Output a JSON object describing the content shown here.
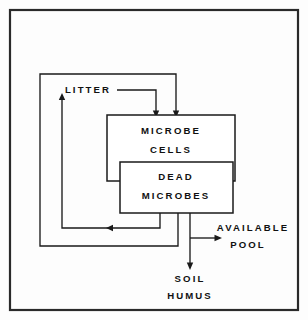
{
  "diagram": {
    "frame": {
      "stroke_color": "#2a2a2a"
    },
    "line_color": "#1a1a1a",
    "background_color": "#fdfdfd",
    "nodes": [
      {
        "id": "litter",
        "label": "LITTER",
        "kind": "text-label",
        "x": 88,
        "y": 90
      },
      {
        "id": "microbe",
        "label_line1": "MICROBE",
        "label_line2": "CELLS",
        "kind": "box",
        "x": 107,
        "y": 115,
        "w": 128,
        "h": 66
      },
      {
        "id": "dead",
        "label_line1": "DEAD",
        "label_line2": "MICROBES",
        "kind": "box",
        "x": 120,
        "y": 162,
        "w": 113,
        "h": 51
      },
      {
        "id": "available",
        "label_line1": "AVAILABLE",
        "label_line2": "POOL",
        "kind": "text-label",
        "x": 243,
        "y": 228
      },
      {
        "id": "soil",
        "label_line1": "SOIL",
        "label_line2": "HUMUS",
        "kind": "text-label",
        "x": 188,
        "y": 279
      }
    ],
    "edges": [
      {
        "id": "litter-to-microbe",
        "from": "litter",
        "to": "microbe",
        "arrow": "down"
      },
      {
        "id": "microbe-to-dead",
        "from": "microbe",
        "to": "dead",
        "arrow": "down"
      },
      {
        "id": "dead-to-available",
        "from": "dead",
        "to": "available",
        "arrow": "right"
      },
      {
        "id": "dead-to-soil",
        "from": "dead",
        "to": "soil",
        "arrow": "down"
      },
      {
        "id": "dead-to-litter",
        "from": "dead",
        "to": "litter",
        "arrow": "up"
      },
      {
        "id": "dead-recycle-inner",
        "from": "dead",
        "to": "dead",
        "arrow": "left"
      },
      {
        "id": "outer-recycle",
        "from": "dead",
        "to": "microbe",
        "arrow": "down"
      }
    ],
    "labels": {
      "litter": "LITTER",
      "microbe_cells_1": "MICROBE",
      "microbe_cells_2": "CELLS",
      "dead_microbes_1": "DEAD",
      "dead_microbes_2": "MICROBES",
      "available_pool_1": "AVAILABLE",
      "available_pool_2": "POOL",
      "soil_humus_1": "SOIL",
      "soil_humus_2": "HUMUS"
    }
  }
}
